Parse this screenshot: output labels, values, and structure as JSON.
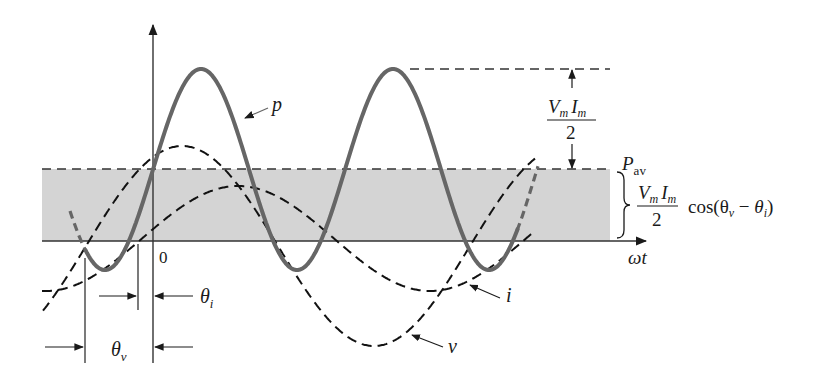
{
  "figure": {
    "colors": {
      "background": "#ffffff",
      "shade": "#d4d4d4",
      "power_curve": "#666666",
      "dashed_curves": "#111111",
      "axis": "#333333"
    }
  },
  "labels": {
    "power": "p",
    "voltage": "v",
    "current": "i",
    "origin": "0",
    "x_axis": "ωt",
    "p_av_main": "P",
    "p_av_sub": "av",
    "amp_num_V": "V",
    "amp_num_m1": "m",
    "amp_num_I": "I",
    "amp_num_m2": "m",
    "amp_den": "2",
    "cos_term": "cos(θ",
    "cos_sub_v": "v",
    "cos_minus": " − ",
    "cos_theta": "θ",
    "cos_sub_i": "i",
    "cos_close": ")",
    "theta_i_main": "θ",
    "theta_i_sub": "i",
    "theta_v_main": "θ",
    "theta_v_sub": "v"
  },
  "chart_data": {
    "type": "line",
    "title": "",
    "xlabel": "ωt",
    "ylabel": "",
    "grid": false,
    "pixel_geometry": {
      "axis_y": 241,
      "y_axis_x": 153,
      "p_av_y": 169,
      "p_peak_y": 69,
      "shade_x": [
        42,
        610
      ]
    },
    "series": [
      {
        "name": "p",
        "style": "solid",
        "color": "#666666",
        "x_start": 70,
        "x_end": 538,
        "center": 169.5,
        "amplitude": 100.5,
        "period": 192,
        "peak_x": 201
      },
      {
        "name": "v",
        "style": "dashed",
        "color": "#111111",
        "x_start": 43,
        "x_end": 535,
        "center": 246,
        "amplitude": 100,
        "period": 384,
        "peak_x": 182
      },
      {
        "name": "i",
        "style": "dashed",
        "color": "#111111",
        "x_start": 42,
        "x_end": 535,
        "center": 238.5,
        "amplitude": 52.5,
        "period": 384,
        "peak_x": 238
      }
    ],
    "annotations": [
      "P_av = (V_m I_m / 2) cos(θ_v − θ_i)",
      "Amplitude of p about P_av = V_m I_m / 2",
      "θ_i: phase offset of current",
      "θ_v: phase offset of voltage"
    ]
  }
}
